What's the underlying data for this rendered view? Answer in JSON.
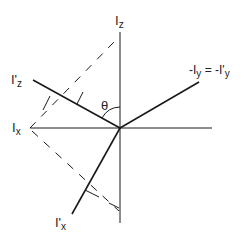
{
  "labels": {
    "iz": "I",
    "iz_sub": "z",
    "ipz": "I'",
    "ipz_sub": "z",
    "ix": "I",
    "ix_sub": "x",
    "ipx": "I'",
    "ipx_sub": "x",
    "iy_left": "-I",
    "iy_left_sub": "y",
    "iy_eq": " = -I'",
    "iy_right_sub": "y",
    "theta": "θ"
  },
  "colors": {
    "line": "#1a1a1a",
    "background": "#ffffff"
  }
}
